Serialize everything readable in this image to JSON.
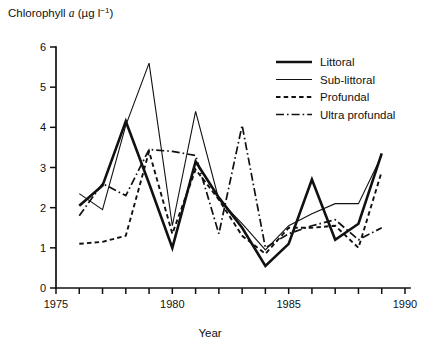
{
  "chart_data": {
    "type": "line",
    "title": "",
    "ylabel_prefix": "Chlorophyll ",
    "ylabel_italic": "a",
    "ylabel_units": " (µg l",
    "ylabel_exponent": "−1",
    "ylabel_suffix": ")",
    "ylabel_full": "Chlorophyll a (µg l−1)",
    "xlabel": "Year",
    "xlim": [
      1975,
      1990
    ],
    "ylim": [
      0,
      6
    ],
    "yticks": [
      0,
      1,
      2,
      3,
      4,
      5,
      6
    ],
    "ytick_labels": [
      "0",
      "1",
      "2",
      "3",
      "4",
      "5",
      "6"
    ],
    "xticks": [
      1975,
      1976,
      1977,
      1978,
      1979,
      1980,
      1981,
      1982,
      1983,
      1984,
      1985,
      1986,
      1987,
      1988,
      1989,
      1990
    ],
    "xtick_labels_shown": [
      "1975",
      "1980",
      "1985",
      "1990"
    ],
    "xtick_label_years": [
      1975,
      1980,
      1985,
      1990
    ],
    "grid": false,
    "legend_position": "top-right",
    "series": [
      {
        "name": "Littoral",
        "style": "solid-thick",
        "x": [
          1976,
          1977,
          1978,
          1979,
          1980,
          1981,
          1982,
          1983,
          1984,
          1985,
          1986,
          1987,
          1988,
          1989
        ],
        "values": [
          2.05,
          2.55,
          4.15,
          2.6,
          1.0,
          3.15,
          2.25,
          1.5,
          0.55,
          1.1,
          2.7,
          1.2,
          1.6,
          3.35
        ]
      },
      {
        "name": "Sub-littoral",
        "style": "solid-thin",
        "x": [
          1976,
          1977,
          1978,
          1979,
          1980,
          1981,
          1982,
          1983,
          1984,
          1985,
          1986,
          1987,
          1988,
          1989
        ],
        "values": [
          2.35,
          1.95,
          4.05,
          5.6,
          1.55,
          4.4,
          2.2,
          1.6,
          0.95,
          1.55,
          1.85,
          2.1,
          2.1,
          3.3
        ]
      },
      {
        "name": "Profundal",
        "style": "dashed",
        "x": [
          1976,
          1977,
          1978,
          1979,
          1980,
          1981,
          1982,
          1983,
          1984,
          1985,
          1986,
          1987,
          1988,
          1989
        ],
        "values": [
          1.1,
          1.15,
          1.3,
          3.4,
          1.35,
          2.95,
          2.2,
          1.3,
          0.85,
          1.5,
          1.5,
          1.55,
          1.0,
          2.9
        ]
      },
      {
        "name": "Ultra profundal",
        "style": "dash-dot",
        "x": [
          1976,
          1977,
          1978,
          1979,
          1980,
          1981,
          1982,
          1983,
          1984,
          1985,
          1986,
          1987,
          1988,
          1989
        ],
        "values": [
          1.8,
          2.6,
          2.3,
          3.45,
          3.4,
          3.3,
          1.35,
          4.05,
          1.0,
          1.35,
          1.55,
          1.7,
          1.2,
          1.5
        ]
      }
    ]
  },
  "legend": {
    "items": [
      {
        "label": "Littoral",
        "style": "solid-thick"
      },
      {
        "label": "Sub-littoral",
        "style": "solid-thin"
      },
      {
        "label": "Profundal",
        "style": "dashed"
      },
      {
        "label": "Ultra profundal",
        "style": "dash-dot"
      }
    ]
  },
  "colors": {
    "ink": "#111111",
    "background": "#ffffff"
  }
}
